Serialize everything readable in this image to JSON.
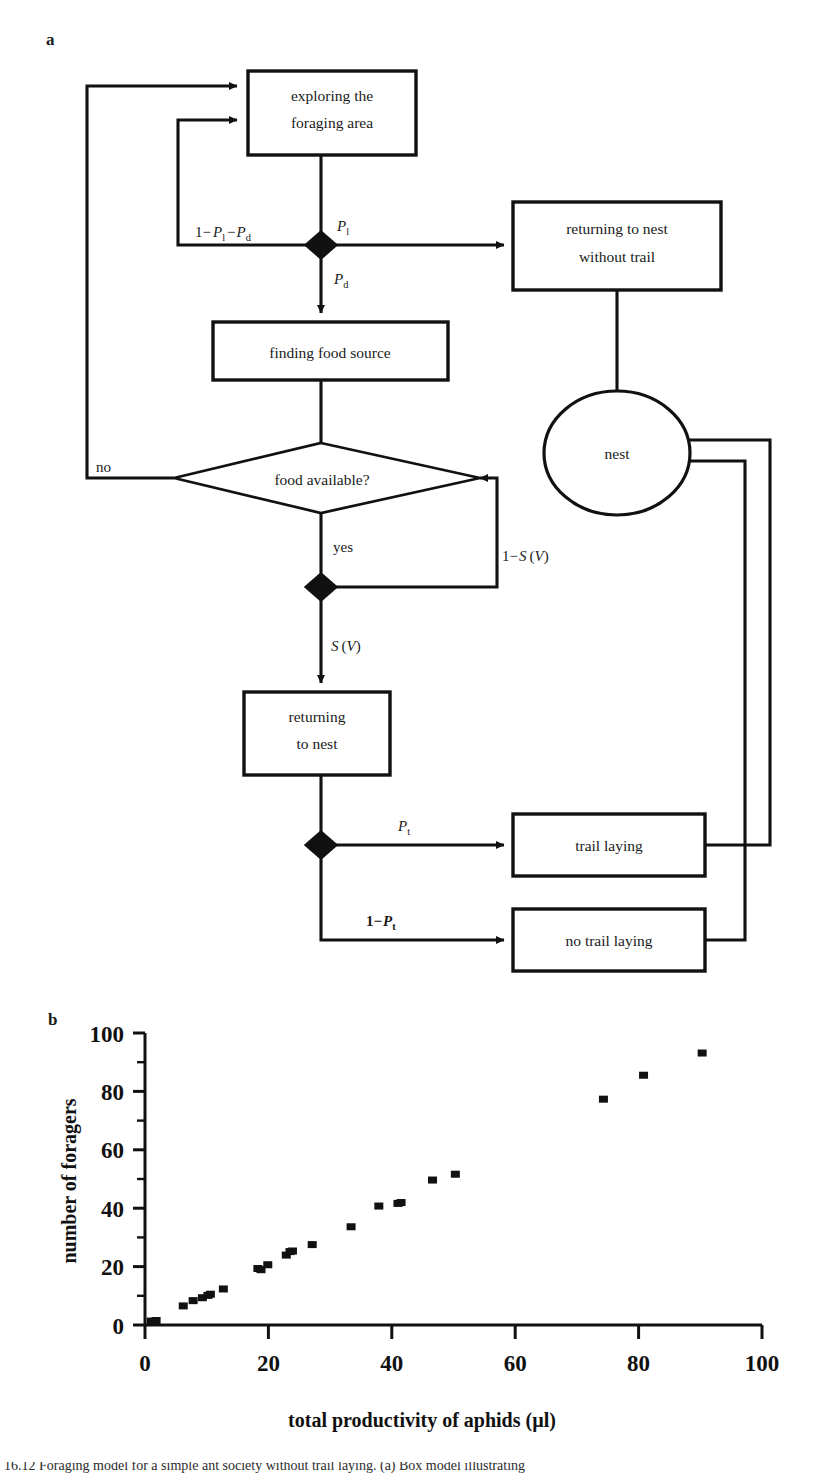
{
  "figure": {
    "panel_a_letter": "a",
    "panel_b_letter": "b",
    "caption_partial": "16.12 Foraging model for a simple ant society without trail laying. (a) Box model illustrating"
  },
  "flowchart": {
    "nodes": {
      "exploring": {
        "line1": "exploring the",
        "line2": "foraging area"
      },
      "returning_without_trail": {
        "line1": "returning to nest",
        "line2": "without trail"
      },
      "finding_food": {
        "line1": "finding food source"
      },
      "food_available": {
        "line1": "food available?"
      },
      "nest": {
        "line1": "nest"
      },
      "returning_to_nest": {
        "line1": "returning",
        "line2": "to nest"
      },
      "trail_laying": {
        "line1": "trail laying"
      },
      "no_trail_laying": {
        "line1": "no trail laying"
      }
    },
    "edge_labels": {
      "one_minus_pl_minus_pd_pre": "1−",
      "p_main": "P",
      "sub_l": "l",
      "sub_d": "d",
      "sub_t": "t",
      "minus": "−",
      "one_minus": "1−",
      "no": "no",
      "yes": "yes",
      "s_symbol": "S",
      "v_open": "(",
      "v_symbol": "V",
      "v_close": ")"
    }
  },
  "chart_data": {
    "type": "scatter",
    "title": "",
    "xlabel": "total productivity of aphids (µl)",
    "ylabel": "number of foragers",
    "xlim": [
      0,
      100
    ],
    "ylim": [
      0,
      100
    ],
    "xticks": [
      0,
      20,
      40,
      60,
      80,
      100
    ],
    "yticks": [
      0,
      20,
      40,
      60,
      80,
      100
    ],
    "xminorticks": [
      10,
      30,
      50,
      70,
      90
    ],
    "yminorticks": [
      10,
      30,
      50,
      70,
      90
    ],
    "grid": false,
    "legend": null,
    "marker": "square",
    "marker_color": "#111111",
    "points": [
      {
        "x": 1.0,
        "y": 1.0
      },
      {
        "x": 1.8,
        "y": 1.2
      },
      {
        "x": 6.2,
        "y": 6.2
      },
      {
        "x": 7.8,
        "y": 8.0
      },
      {
        "x": 9.3,
        "y": 9.0
      },
      {
        "x": 10.2,
        "y": 9.8
      },
      {
        "x": 10.6,
        "y": 10.2
      },
      {
        "x": 12.7,
        "y": 12.0
      },
      {
        "x": 18.3,
        "y": 19.0
      },
      {
        "x": 18.8,
        "y": 18.6
      },
      {
        "x": 19.9,
        "y": 20.3
      },
      {
        "x": 22.9,
        "y": 23.6
      },
      {
        "x": 23.5,
        "y": 24.8
      },
      {
        "x": 23.9,
        "y": 25.0
      },
      {
        "x": 27.1,
        "y": 27.2
      },
      {
        "x": 33.4,
        "y": 33.3
      },
      {
        "x": 37.9,
        "y": 40.4
      },
      {
        "x": 41.0,
        "y": 41.3
      },
      {
        "x": 41.5,
        "y": 41.6
      },
      {
        "x": 46.6,
        "y": 49.3
      },
      {
        "x": 50.3,
        "y": 51.3
      },
      {
        "x": 74.3,
        "y": 77.0
      },
      {
        "x": 80.8,
        "y": 85.2
      },
      {
        "x": 90.3,
        "y": 92.8
      }
    ]
  }
}
